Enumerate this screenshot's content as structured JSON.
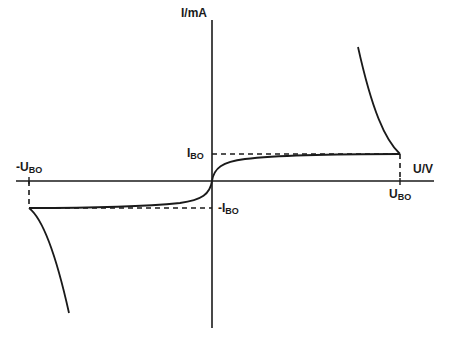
{
  "diagram": {
    "axes": {
      "y_label": "I/mA",
      "x_label": "U/V"
    },
    "labels": {
      "i_bo_pos": {
        "main": "I",
        "sub": "BO"
      },
      "i_bo_neg": {
        "main": "-I",
        "sub": "BO"
      },
      "u_bo_pos": {
        "main": "U",
        "sub": "BO"
      },
      "u_bo_neg": {
        "main": "-U",
        "sub": "BO"
      }
    },
    "colors": {
      "line": "#1a1a1a",
      "background": "#ffffff"
    }
  }
}
